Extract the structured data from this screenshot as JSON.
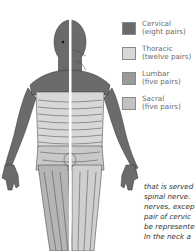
{
  "legend": {
    "items": [
      {
        "name": "Cervical",
        "detail": "(eight pairs)",
        "color": "#6b6b6b"
      },
      {
        "name": "Thoracic",
        "detail": "(twelve pairs)",
        "color": "#d8d8d8"
      },
      {
        "name": "Lumbar",
        "detail": "(five pairs)",
        "color": "#9a9a9a"
      },
      {
        "name": "Sacral",
        "detail": "(five pairs)",
        "color": "#c2c2c2"
      }
    ]
  },
  "body_text": {
    "lines": [
      "that is served",
      "spinal nerve.",
      "nerves, excep",
      "pair of cervic",
      "be represente",
      "In the neck a"
    ]
  },
  "figure": {
    "colors": {
      "cervical": "#6b6b6b",
      "thoracic": "#d8d8d8",
      "lumbar": "#9a9a9a",
      "sacral": "#c2c2c2",
      "outline": "#333333",
      "divider": "#ffffff"
    }
  }
}
